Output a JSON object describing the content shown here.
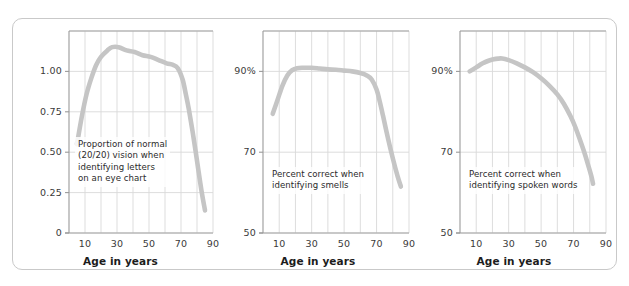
{
  "figure": {
    "background_color": "#ffffff",
    "border_color": "#c9c9c9",
    "curve_color": "#c5c5c5",
    "grid_color": "#d9d9d9",
    "axis_color": "#9a9a9a",
    "text_color": "#2b2b2b"
  },
  "chart_data": [
    {
      "type": "line",
      "title": "",
      "annotation": "Proportion of normal\n(20/20) vision when\nidentifying letters\non an eye chart",
      "xlabel": "Age in years",
      "ylabel": "",
      "xlim": [
        0,
        90
      ],
      "ylim": [
        0,
        1.25
      ],
      "grid": true,
      "xticks": [
        10,
        30,
        50,
        70,
        90
      ],
      "xticklabels": [
        "10",
        "30",
        "50",
        "70",
        "90"
      ],
      "xgridlines": [
        10,
        20,
        30,
        40,
        50,
        60,
        70,
        80,
        90
      ],
      "yticks": [
        0,
        0.25,
        0.5,
        0.75,
        1.0
      ],
      "yticklabels": [
        "0",
        "0.25",
        "0.50",
        "0.75",
        "1.00"
      ],
      "x": [
        5,
        8,
        11,
        14,
        17,
        20,
        24,
        27,
        31,
        36,
        41,
        46,
        51,
        56,
        61,
        65,
        68,
        71,
        73,
        75,
        78,
        81,
        83,
        85
      ],
      "values": [
        0.55,
        0.72,
        0.86,
        0.96,
        1.04,
        1.09,
        1.13,
        1.15,
        1.15,
        1.13,
        1.12,
        1.1,
        1.09,
        1.07,
        1.05,
        1.04,
        1.02,
        0.95,
        0.86,
        0.76,
        0.58,
        0.38,
        0.25,
        0.14
      ]
    },
    {
      "type": "line",
      "title": "",
      "annotation": "Percent correct when\nidentifying smells",
      "xlabel": "Age in years",
      "ylabel": "",
      "xlim": [
        0,
        90
      ],
      "ylim": [
        50,
        100
      ],
      "grid": true,
      "xticks": [
        10,
        30,
        50,
        70,
        90
      ],
      "xticklabels": [
        "10",
        "30",
        "50",
        "70",
        "90"
      ],
      "xgridlines": [
        10,
        20,
        30,
        40,
        50,
        60,
        70,
        80,
        90
      ],
      "yticks": [
        50,
        70,
        90
      ],
      "yticklabels": [
        "50",
        "70",
        "90%"
      ],
      "x": [
        6,
        9,
        12,
        15,
        18,
        21,
        25,
        30,
        35,
        40,
        45,
        50,
        55,
        60,
        64,
        67,
        70,
        72,
        74,
        77,
        80,
        83,
        85
      ],
      "values": [
        79.5,
        83.0,
        86.5,
        89.0,
        90.3,
        90.8,
        90.9,
        90.9,
        90.7,
        90.5,
        90.4,
        90.2,
        90.0,
        89.6,
        89.0,
        88.0,
        85.5,
        82.5,
        79.0,
        73.5,
        68.5,
        64.0,
        61.5
      ]
    },
    {
      "type": "line",
      "title": "",
      "annotation": "Percent correct when\nidentifying spoken words",
      "xlabel": "Age in years",
      "ylabel": "",
      "xlim": [
        0,
        90
      ],
      "ylim": [
        50,
        100
      ],
      "grid": true,
      "xticks": [
        10,
        30,
        50,
        70,
        90
      ],
      "xticklabels": [
        "10",
        "30",
        "50",
        "70",
        "90"
      ],
      "xgridlines": [
        10,
        20,
        30,
        40,
        50,
        60,
        70,
        80,
        90
      ],
      "yticks": [
        50,
        70,
        90
      ],
      "yticklabels": [
        "50",
        "70",
        "90%"
      ],
      "x": [
        6,
        10,
        14,
        18,
        22,
        26,
        30,
        35,
        40,
        45,
        50,
        55,
        60,
        64,
        68,
        71,
        74,
        77,
        79,
        81,
        82
      ],
      "values": [
        90.0,
        91.0,
        92.0,
        92.7,
        93.1,
        93.2,
        92.8,
        92.0,
        91.0,
        89.8,
        88.3,
        86.5,
        84.3,
        82.0,
        79.0,
        76.3,
        73.0,
        69.5,
        66.8,
        64.0,
        62.2
      ]
    }
  ]
}
